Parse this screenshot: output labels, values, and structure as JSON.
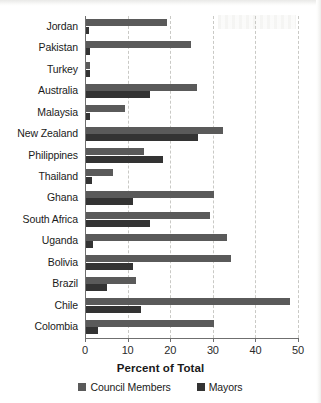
{
  "chart_data": {
    "type": "bar",
    "orientation": "horizontal",
    "title": "",
    "xlabel": "Percent of Total",
    "ylabel": "",
    "xlim": [
      0,
      50
    ],
    "xticks": [
      0,
      10,
      20,
      30,
      40,
      50
    ],
    "xtick_labels": [
      "0",
      "10",
      "20",
      "30",
      "40",
      "50"
    ],
    "grid": "vertical-dashed",
    "legend_position": "bottom",
    "categories": [
      "Jordan",
      "Pakistan",
      "Turkey",
      "Australia",
      "Malaysia",
      "New Zealand",
      "Philippines",
      "Thailand",
      "Ghana",
      "South Africa",
      "Uganda",
      "Bolivia",
      "Brazil",
      "Chile",
      "Colombia"
    ],
    "series": [
      {
        "name": "Council Members",
        "color": "#5a5a5a",
        "values": [
          19.0,
          24.7,
          1.0,
          26.0,
          9.2,
          32.2,
          13.6,
          6.4,
          30.0,
          29.0,
          33.0,
          34.0,
          11.8,
          48.0,
          30.0
        ]
      },
      {
        "name": "Mayors",
        "color": "#333333",
        "values": [
          0.8,
          0.9,
          0.9,
          15.0,
          0.9,
          26.2,
          18.0,
          1.3,
          11.0,
          15.0,
          1.6,
          11.0,
          4.9,
          13.0,
          2.9
        ]
      }
    ]
  },
  "axis": {
    "x_title": "Percent of Total"
  },
  "legend": {
    "items": [
      {
        "label": "Council Members",
        "color": "#5a5a5a",
        "swatch": "legend-swatch-icon"
      },
      {
        "label": "Mayors",
        "color": "#333333",
        "swatch": "legend-swatch-icon"
      }
    ]
  }
}
